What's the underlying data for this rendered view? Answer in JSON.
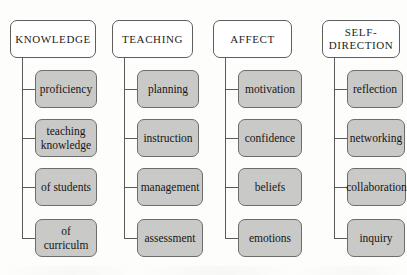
{
  "diagram": {
    "colors": {
      "background": "#fdfdfb",
      "root_fill": "#ffffff",
      "leaf_fill": "#c9c9c7",
      "border": "#5f5f5f",
      "connector": "#5a5a5a",
      "text": "#1d1d1d"
    },
    "columns": [
      {
        "id": "knowledge",
        "root": "KNOWLEDGE",
        "leaves": [
          "proficiency",
          "teaching\nknowledge",
          "of students",
          "of curriculm"
        ]
      },
      {
        "id": "teaching",
        "root": "TEACHING",
        "leaves": [
          "planning",
          "instruction",
          "management",
          "assessment"
        ]
      },
      {
        "id": "affect",
        "root": "AFFECT",
        "leaves": [
          "motivation",
          "confidence",
          "beliefs",
          "emotions"
        ]
      },
      {
        "id": "self-direction",
        "root": "SELF-\nDIRECTION",
        "leaves": [
          "reflection",
          "networking",
          "collaboration",
          "inquiry"
        ]
      }
    ]
  }
}
